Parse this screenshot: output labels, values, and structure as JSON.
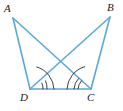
{
  "figure": {
    "width": 123,
    "height": 111,
    "background_color": "#ffffff",
    "line_color": "#5BA9D8",
    "arc_color": "#2b2b2b",
    "label_color": "#1a1a1a",
    "line_width": 1.6,
    "arc_width": 0.9
  },
  "vertices": [
    {
      "id": "A",
      "label": "A",
      "x": 13,
      "y": 18,
      "label_x": 4,
      "label_y": 3
    },
    {
      "id": "B",
      "label": "B",
      "x": 110,
      "y": 17,
      "label_x": 107,
      "label_y": 2
    },
    {
      "id": "D",
      "label": "D",
      "x": 30,
      "y": 89,
      "label_x": 20,
      "label_y": 92
    },
    {
      "id": "C",
      "label": "C",
      "x": 91,
      "y": 89,
      "label_x": 87,
      "label_y": 92
    }
  ],
  "segments": [
    {
      "name": "side-AD",
      "from": "A",
      "to": "D",
      "x1": 13,
      "y1": 18,
      "x2": 30,
      "y2": 89
    },
    {
      "name": "side-BC",
      "from": "B",
      "to": "C",
      "x1": 110,
      "y1": 17,
      "x2": 91,
      "y2": 89
    },
    {
      "name": "base-DC",
      "from": "D",
      "to": "C",
      "x1": 30,
      "y1": 89,
      "x2": 91,
      "y2": 89
    },
    {
      "name": "diagonal-AC",
      "from": "A",
      "to": "C",
      "x1": 13,
      "y1": 18,
      "x2": 91,
      "y2": 89
    },
    {
      "name": "diagonal-BD",
      "from": "B",
      "to": "D",
      "x1": 110,
      "y1": 17,
      "x2": 30,
      "y2": 89
    }
  ],
  "angle_marks": [
    {
      "name": "angle-ADC-large-arc",
      "vertex": "D",
      "angle": "ADC",
      "arc_count": 1,
      "radius": 24,
      "path": "M 36.6 66.9 A 24 24 0 0 1 54 89"
    },
    {
      "name": "angle-BDC-double-arc-outer",
      "vertex": "D",
      "angle": "BDC",
      "arc_count": 2,
      "radius": 17,
      "path": "M 45.6 80.9 A 17 17 0 0 1 47 89"
    },
    {
      "name": "angle-BDC-double-arc-inner",
      "vertex": "D",
      "angle": "BDC",
      "arc_count": 2,
      "radius": 13,
      "path": "M 41.9 83.1 A 13 13 0 0 1 43 89"
    },
    {
      "name": "angle-BCD-large-arc",
      "vertex": "C",
      "angle": "BCD",
      "arc_count": 1,
      "radius": 24,
      "path": "M 67 89 A 24 24 0 0 1 84.7 66.7"
    },
    {
      "name": "angle-ACD-double-arc-outer",
      "vertex": "C",
      "angle": "ACD",
      "arc_count": 2,
      "radius": 17,
      "path": "M 74 89 A 17 17 0 0 1 78.5 78.4"
    },
    {
      "name": "angle-ACD-double-arc-inner",
      "vertex": "C",
      "angle": "ACD",
      "arc_count": 2,
      "radius": 13,
      "path": "M 78 89 A 13 13 0 0 1 81.4 80.9"
    }
  ]
}
